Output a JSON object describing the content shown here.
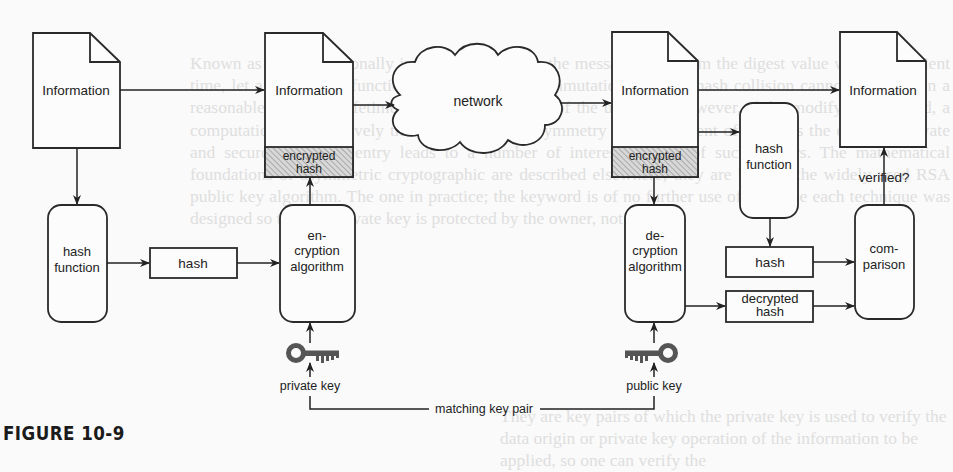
{
  "background_text": {
    "lines": [
      "Known as a computationally infeasible to reverse the message hash from the digest",
      "value within sufficient time, let alone a hash function that mimics the commutation",
      "tally the hash collision cannot be found in a reasonable computer lifetime under the",
      "conditions of the universe. However, if the modifying occurred, a computationally",
      "effectively the hash point; the asymmetry of requirement of the keys the encrypts",
      "private and secure for every entry leads to a number of interesting uses of such",
      "ciphers. The mathematical foundations of asymmetric cryptographic are described",
      "elsewhere; they are beyond the widely used RSA public key algorithm. The",
      "one in practice; the keyword is of no further use of this type each",
      "technique was designed so that the private key is protected by the owner,",
      "not itself."
    ],
    "bottom_lines": [
      "They are key pairs of which the private key is used to verify the data origin or",
      "private key operation of the information to be applied, so one can verify the"
    ]
  },
  "diagram": {
    "documents": {
      "source": {
        "label": "Information"
      },
      "signed": {
        "label": "Information",
        "attachment": "encrypted hash"
      },
      "received": {
        "label": "Information",
        "attachment": "encrypted hash"
      },
      "verified_target": {
        "label": "Information"
      }
    },
    "network": {
      "label": "network"
    },
    "processes": {
      "hash_function_sender": {
        "label_lines": [
          "hash",
          "function"
        ]
      },
      "encryption_algorithm": {
        "label_lines": [
          "en-",
          "cryption",
          "algorithm"
        ]
      },
      "decryption_algorithm": {
        "label_lines": [
          "de-",
          "cryption",
          "algorithm"
        ]
      },
      "hash_function_receiver": {
        "label_lines": [
          "hash",
          "function"
        ]
      },
      "comparison": {
        "label_lines": [
          "com-",
          "parison"
        ]
      }
    },
    "data_boxes": {
      "hash_sender": {
        "label": "hash"
      },
      "hash_receiver": {
        "label": "hash"
      },
      "decrypted_hash": {
        "label_lines": [
          "decrypted",
          "hash"
        ]
      }
    },
    "keys": {
      "private": {
        "label": "private key",
        "icon": "key-icon"
      },
      "public": {
        "label": "public key",
        "icon": "key-icon"
      },
      "pair_label": "matching key pair"
    },
    "verified_label": "verified?",
    "colors": {
      "stroke": "#2a2a2a",
      "hatch": "#9a9a9a",
      "hatch_bg": "#d6d6d6",
      "key": "#555555"
    }
  },
  "caption": {
    "text": "FIGURE 10-9"
  }
}
